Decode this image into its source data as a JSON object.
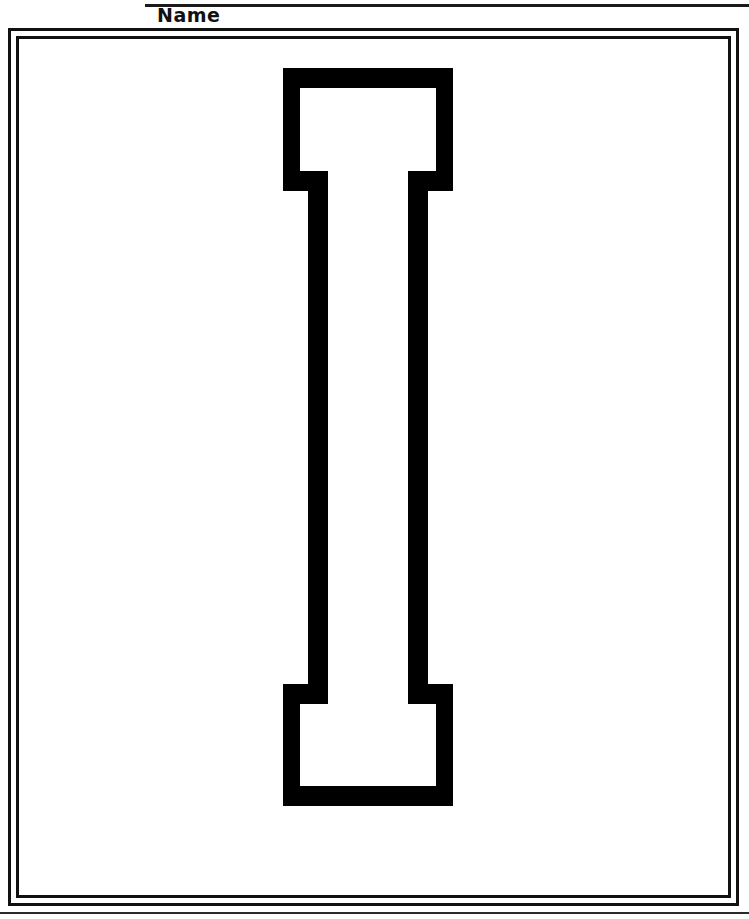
{
  "worksheet": {
    "title": "Letter I Coloring / Tracing Worksheet",
    "page_width": 749,
    "page_height": 919,
    "background_color": "#ffffff",
    "ink_color": "#111111"
  },
  "header": {
    "name_label": "Name",
    "rule_present": true
  },
  "frame": {
    "style": "double-rule rectangle",
    "outer_stroke": "#111111",
    "inner_stroke": "#111111",
    "stroke_width_px": 3
  },
  "letter": {
    "character": "I",
    "case": "uppercase",
    "style": "serif outline (hollow)",
    "fill": "#ffffff",
    "stroke": "#111111",
    "description": "Large hollow capital letter I with slab serifs at top and bottom, centered on the page for coloring or tracing."
  },
  "footer": {
    "rule_present": true
  }
}
